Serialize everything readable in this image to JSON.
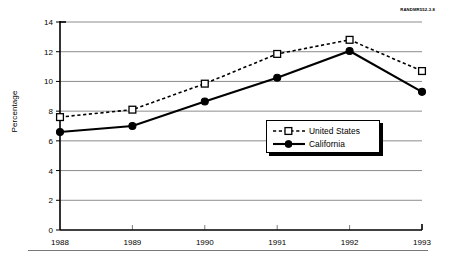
{
  "figure": {
    "source_id": "RANDMR552-3.8"
  },
  "chart_data": {
    "type": "line",
    "title": "",
    "xlabel": "",
    "ylabel": "Percentage",
    "categories": [
      "1988",
      "1989",
      "1990",
      "1991",
      "1992",
      "1993"
    ],
    "x": [
      1988,
      1989,
      1990,
      1991,
      1992,
      1993
    ],
    "xlim": [
      1988,
      1993
    ],
    "ylim": [
      0,
      14
    ],
    "yticks": [
      0,
      2,
      4,
      6,
      8,
      10,
      12,
      14
    ],
    "ytick_labels": [
      "0",
      "2",
      "4",
      "6",
      "8",
      "10",
      "12",
      "14"
    ],
    "xtick_labels": [
      "1988",
      "1989",
      "1990",
      "1991",
      "1992",
      "1993"
    ],
    "grid": "horizontal",
    "legend_position": "center-right",
    "series": [
      {
        "name": "United States",
        "values": [
          7.6,
          8.1,
          9.85,
          11.85,
          12.8,
          10.7
        ],
        "line_style": "dashed",
        "marker": "open-square",
        "color": "#000000"
      },
      {
        "name": "California",
        "values": [
          6.6,
          7.0,
          8.65,
          10.25,
          12.05,
          9.3
        ],
        "line_style": "solid",
        "marker": "filled-circle",
        "color": "#000000"
      }
    ]
  },
  "legend": {
    "entries": [
      {
        "label": "United States"
      },
      {
        "label": "California"
      }
    ]
  }
}
